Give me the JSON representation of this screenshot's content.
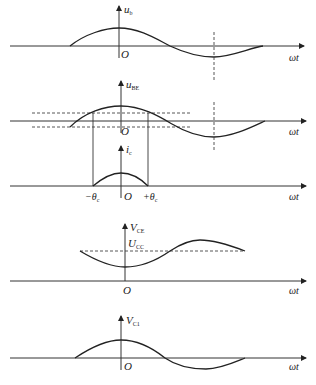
{
  "diagram": {
    "type": "waveform-diagram",
    "colors": {
      "line": "#222222",
      "background": "#ffffff"
    },
    "time_axis_label": "ωt",
    "origin_label": "O",
    "panels": [
      {
        "id": "ub",
        "y_label": "u",
        "y_sub": "b",
        "description": "input base voltage signal, cosine shape"
      },
      {
        "id": "ube",
        "y_label": "u",
        "y_sub": "BE",
        "description": "base-emitter voltage with dashed threshold levels"
      },
      {
        "id": "ic",
        "y_label": "i",
        "y_sub": "c",
        "description": "collector current pulse between conduction angles",
        "ticks": {
          "neg": "−θ",
          "neg_sub": "c",
          "pos": "+θ",
          "pos_sub": "c"
        }
      },
      {
        "id": "vce",
        "y_label": "V",
        "y_sub": "CE",
        "dc_label": "U",
        "dc_sub": "CC",
        "description": "collector-emitter voltage around Ucc"
      },
      {
        "id": "vc1",
        "y_label": "V",
        "y_sub": "C1",
        "description": "fundamental collector voltage component"
      }
    ]
  }
}
